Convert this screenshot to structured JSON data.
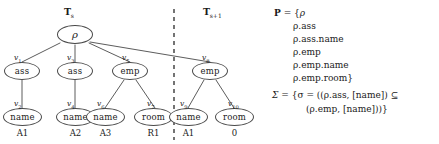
{
  "figure": {
    "tree_left": {
      "caption_base": "T",
      "caption_sub": "s"
    },
    "tree_right": {
      "caption_base": "T",
      "caption_sub": "s+1"
    },
    "divider": "dashed-vertical-separator",
    "root": {
      "id": "root",
      "label": "ρ"
    },
    "nodes": [
      {
        "id": "v1",
        "vlabel_base": "v",
        "vlabel_sub": "1",
        "label": "ass",
        "leafval": null
      },
      {
        "id": "v2",
        "vlabel_base": "v",
        "vlabel_sub": "2",
        "label": "name",
        "leafval": "A1"
      },
      {
        "id": "v3",
        "vlabel_base": "v",
        "vlabel_sub": "3",
        "label": "ass",
        "leafval": null
      },
      {
        "id": "v4",
        "vlabel_base": "v",
        "vlabel_sub": "4",
        "label": "name",
        "leafval": "A2"
      },
      {
        "id": "v5",
        "vlabel_base": "v",
        "vlabel_sub": "5",
        "label": "emp",
        "leafval": null
      },
      {
        "id": "v6",
        "vlabel_base": "v",
        "vlabel_sub": "6",
        "label": "name",
        "leafval": "A3"
      },
      {
        "id": "v7",
        "vlabel_base": "v",
        "vlabel_sub": "7",
        "label": "room",
        "leafval": "R1"
      },
      {
        "id": "v8",
        "vlabel_base": "v",
        "vlabel_sub": "8",
        "label": "emp",
        "leafval": null
      },
      {
        "id": "v9",
        "vlabel_base": "v",
        "vlabel_sub": "9",
        "label": "name",
        "leafval": "A1"
      },
      {
        "id": "v10",
        "vlabel_base": "v",
        "vlabel_sub": "10",
        "label": "room",
        "leafval": "0"
      }
    ]
  },
  "paths": {
    "header_symbol": "P",
    "header_eq": "=",
    "open_brace": "{",
    "items": [
      "ρ",
      "ρ.ass",
      "ρ.ass.name",
      "ρ.emp",
      "ρ.emp.name",
      "ρ.emp.room}"
    ]
  },
  "constraints": {
    "header_symbol": "Σ",
    "header_eq": "=",
    "line1": "{σ = ((ρ.ass, [name]) ⊆",
    "line2": "(ρ.emp, [name]))}"
  }
}
